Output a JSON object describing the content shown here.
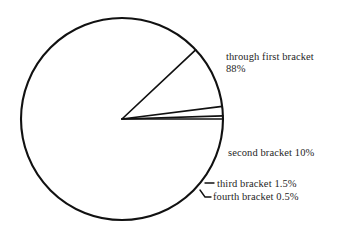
{
  "chart_data": {
    "type": "pie",
    "title": "",
    "xlabel": "",
    "ylabel": "",
    "legend_position": "callout-labels-right",
    "grid": false,
    "start_angle_deg": 0,
    "direction": "clockwise",
    "categories": [
      "through first bracket",
      "second bracket",
      "third bracket",
      "fourth bracket"
    ],
    "values": [
      88,
      10,
      1.5,
      0.5
    ],
    "unit": "%",
    "slices": [
      {
        "name": "through first bracket",
        "value": 88,
        "value_label": "88%",
        "label_line_1": "through first bracket",
        "label_line_2": "88%",
        "start_angle_deg": 0,
        "end_angle_deg": 316.8
      },
      {
        "name": "second bracket",
        "value": 10,
        "value_label": "10%",
        "label_line_1": "second bracket 10%",
        "start_angle_deg": 316.8,
        "end_angle_deg": 280.8
      },
      {
        "name": "third bracket",
        "value": 1.5,
        "value_label": "1.5%",
        "label_line_1": "third bracket 1.5%",
        "start_angle_deg": 280.8,
        "end_angle_deg": 275.4
      },
      {
        "name": "fourth bracket",
        "value": 0.5,
        "value_label": "0.5%",
        "label_line_1": "fourth bracket 0.5%",
        "start_angle_deg": 275.4,
        "end_angle_deg": 273.6
      }
    ],
    "colors": {
      "stroke": "#111111",
      "fill": "#ffffff",
      "text": "#262626",
      "background": "#ffffff"
    }
  },
  "labels": {
    "first_line_1": "through first bracket",
    "first_line_2": "88%",
    "second": "second bracket 10%",
    "third": "third bracket 1.5%",
    "fourth": "fourth bracket 0.5%"
  }
}
